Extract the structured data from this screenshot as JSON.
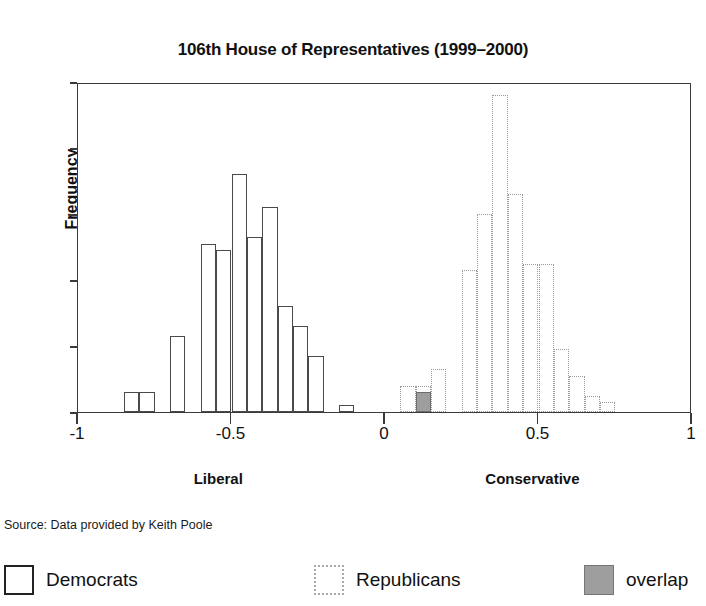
{
  "chart_data": {
    "type": "bar",
    "title": "106th House of Representatives (1999–2000)",
    "xlabel": "",
    "ylabel": "Frequency",
    "xlim": [
      -1,
      1
    ],
    "ylim": [
      0,
      50
    ],
    "bin_width": 0.05,
    "grid": false,
    "x_ticks": [
      "-1",
      "-0.5",
      "0",
      "0.5",
      "1"
    ],
    "x_tick_values": [
      -1,
      -0.5,
      0,
      0.5,
      1
    ],
    "y_ticks": [
      "0",
      "10",
      "20",
      "30",
      "40",
      "50"
    ],
    "y_tick_values": [
      0,
      10,
      20,
      30,
      40,
      50
    ],
    "axis_end_labels": {
      "left": "Liberal",
      "right": "Conservative"
    },
    "source_note": "Source: Data provided by Keith Poole",
    "legend": {
      "position": "below",
      "entries": [
        {
          "name": "democrats",
          "label": "Democrats",
          "style": "solid-outline",
          "color": "#ffffff",
          "border": "#222222"
        },
        {
          "name": "republicans",
          "label": "Republicans",
          "style": "dotted-outline",
          "color": "#ffffff",
          "border": "#aaaaaa"
        },
        {
          "name": "overlap",
          "label": "overlap",
          "style": "filled",
          "color": "#9e9e9e",
          "border": "#777777"
        }
      ]
    },
    "series": [
      {
        "name": "Democrats",
        "bins": [
          {
            "x0": -0.85,
            "x1": -0.8,
            "value": 3
          },
          {
            "x0": -0.8,
            "x1": -0.75,
            "value": 3
          },
          {
            "x0": -0.75,
            "x1": -0.7,
            "value": 0
          },
          {
            "x0": -0.7,
            "x1": -0.65,
            "value": 11.5
          },
          {
            "x0": -0.65,
            "x1": -0.6,
            "value": 0
          },
          {
            "x0": -0.6,
            "x1": -0.55,
            "value": 25.5
          },
          {
            "x0": -0.55,
            "x1": -0.5,
            "value": 24.5
          },
          {
            "x0": -0.5,
            "x1": -0.45,
            "value": 36
          },
          {
            "x0": -0.45,
            "x1": -0.4,
            "value": 26.5
          },
          {
            "x0": -0.4,
            "x1": -0.35,
            "value": 31
          },
          {
            "x0": -0.35,
            "x1": -0.3,
            "value": 16
          },
          {
            "x0": -0.3,
            "x1": -0.25,
            "value": 13
          },
          {
            "x0": -0.25,
            "x1": -0.2,
            "value": 8.5
          },
          {
            "x0": -0.2,
            "x1": -0.15,
            "value": 0
          },
          {
            "x0": -0.15,
            "x1": -0.1,
            "value": 1
          },
          {
            "x0": 0.1,
            "x1": 0.15,
            "value": 3
          }
        ]
      },
      {
        "name": "Republicans",
        "bins": [
          {
            "x0": 0.05,
            "x1": 0.1,
            "value": 4
          },
          {
            "x0": 0.1,
            "x1": 0.15,
            "value": 4
          },
          {
            "x0": 0.15,
            "x1": 0.2,
            "value": 6.5
          },
          {
            "x0": 0.2,
            "x1": 0.25,
            "value": 0
          },
          {
            "x0": 0.25,
            "x1": 0.3,
            "value": 21.5
          },
          {
            "x0": 0.3,
            "x1": 0.35,
            "value": 30
          },
          {
            "x0": 0.35,
            "x1": 0.4,
            "value": 48
          },
          {
            "x0": 0.4,
            "x1": 0.45,
            "value": 33
          },
          {
            "x0": 0.45,
            "x1": 0.5,
            "value": 22.5
          },
          {
            "x0": 0.5,
            "x1": 0.55,
            "value": 22.5
          },
          {
            "x0": 0.55,
            "x1": 0.6,
            "value": 9.5
          },
          {
            "x0": 0.6,
            "x1": 0.65,
            "value": 5.5
          },
          {
            "x0": 0.65,
            "x1": 0.7,
            "value": 2.5
          },
          {
            "x0": 0.7,
            "x1": 0.75,
            "value": 1.5
          }
        ]
      },
      {
        "name": "overlap",
        "bins": [
          {
            "x0": 0.1,
            "x1": 0.15,
            "value": 3
          }
        ]
      }
    ]
  }
}
